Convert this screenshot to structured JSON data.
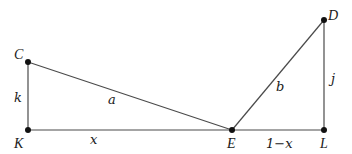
{
  "diagram": {
    "points": {
      "C": {
        "label": "C",
        "x": 28,
        "y": 62
      },
      "K": {
        "label": "K",
        "x": 28,
        "y": 130
      },
      "E": {
        "label": "E",
        "x": 232,
        "y": 130
      },
      "L": {
        "label": "L",
        "x": 324,
        "y": 130
      },
      "D": {
        "label": "D",
        "x": 324,
        "y": 20
      }
    },
    "segments": {
      "CK": {
        "label": "k"
      },
      "KE": {
        "label": "x"
      },
      "CE": {
        "label": "a"
      },
      "ED": {
        "label": "b"
      },
      "EL": {
        "label": "1−x"
      },
      "DL": {
        "label": "j"
      }
    },
    "colors": {
      "line": "#4a4a4a",
      "point": "#111111",
      "text": "#1a1a1a"
    }
  }
}
